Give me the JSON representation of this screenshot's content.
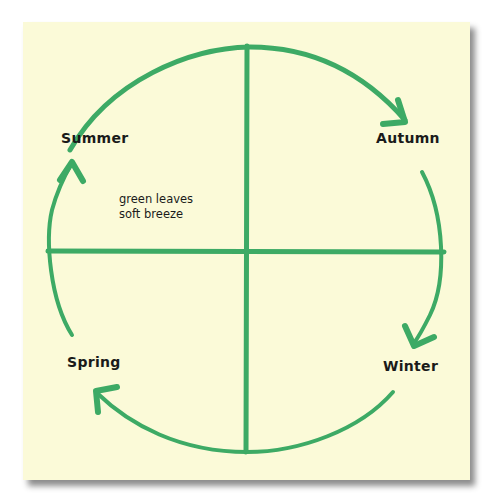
{
  "diagram": {
    "type": "seasonal-cycle",
    "colors": {
      "paper": "#fbfad8",
      "stroke": "#3daa65",
      "text": "#1a1a1a"
    },
    "seasons": [
      {
        "name": "summer",
        "label": "Summer"
      },
      {
        "name": "autumn",
        "label": "Autumn"
      },
      {
        "name": "winter",
        "label": "Winter"
      },
      {
        "name": "spring",
        "label": "Spring"
      }
    ],
    "note": {
      "line1": "green leaves",
      "line2": "soft breeze"
    },
    "flow": [
      "Summer",
      "Autumn",
      "Winter",
      "Spring",
      "Summer"
    ]
  }
}
